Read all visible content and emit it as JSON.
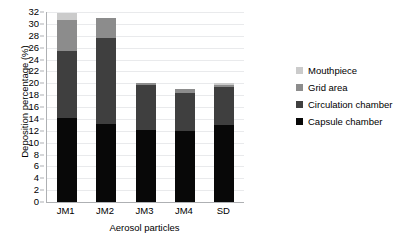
{
  "chart_data": {
    "type": "bar",
    "stacked": true,
    "title": "",
    "xlabel": "Aerosol particles",
    "ylabel": "Deposition percentage (%)",
    "categories": [
      "JM1",
      "JM2",
      "JM3",
      "JM4",
      "SD"
    ],
    "ylim": [
      0,
      32
    ],
    "ytick_step": 2,
    "yticks": [
      0,
      2,
      4,
      6,
      8,
      10,
      12,
      14,
      16,
      18,
      20,
      22,
      24,
      26,
      28,
      30,
      32
    ],
    "ytick_labels": [
      "0",
      "2",
      "4",
      "6",
      "8",
      "10",
      "12",
      "14",
      "16",
      "18",
      "20",
      "22",
      "24",
      "26",
      "28",
      "30",
      "32"
    ],
    "grid": true,
    "grid_axis": "y",
    "legend_position": "right",
    "series": [
      {
        "name": "Capsule chamber",
        "color": "#080808",
        "values": [
          14.2,
          13.1,
          12.1,
          12.0,
          13.0
        ]
      },
      {
        "name": "Circulation chamber",
        "color": "#3f3f3f",
        "values": [
          11.3,
          14.6,
          7.6,
          6.3,
          6.3
        ]
      },
      {
        "name": "Grid area",
        "color": "#8c8c8c",
        "values": [
          5.1,
          3.3,
          0.3,
          0.7,
          0.4
        ]
      },
      {
        "name": "Mouthpiece",
        "color": "#cbcbcb",
        "values": [
          1.2,
          0.0,
          0.0,
          0.0,
          0.3
        ]
      }
    ],
    "totals": [
      31.8,
      31.0,
      20.0,
      19.0,
      20.0
    ],
    "legend_entries": [
      {
        "label": "Mouthpiece",
        "color": "#cbcbcb"
      },
      {
        "label": "Grid area",
        "color": "#8c8c8c"
      },
      {
        "label": "Circulation chamber",
        "color": "#3f3f3f"
      },
      {
        "label": "Capsule chamber",
        "color": "#080808"
      }
    ],
    "axis_color": "#aeb0b3",
    "gridline_color": "#e9eaec",
    "background": "#ffffff"
  }
}
